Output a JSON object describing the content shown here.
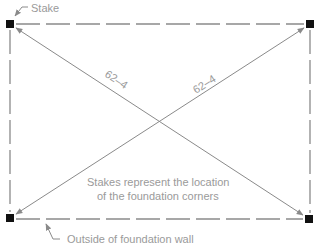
{
  "diagram": {
    "labels": {
      "stake": "Stake",
      "diagonal_a": "62–4",
      "diagonal_b": "62–4",
      "note_line1": "Stakes represent the location",
      "note_line2": "of the foundation corners",
      "wall": "Outside of foundation wall"
    },
    "corners": [
      {
        "name": "top-left",
        "x": 10,
        "y": 24
      },
      {
        "name": "top-right",
        "x": 310,
        "y": 24
      },
      {
        "name": "bottom-left",
        "x": 10,
        "y": 218
      },
      {
        "name": "bottom-right",
        "x": 309,
        "y": 219
      }
    ],
    "colors": {
      "stake": "#111111",
      "line": "#8a8a8a",
      "text": "#9a9a9a"
    }
  }
}
